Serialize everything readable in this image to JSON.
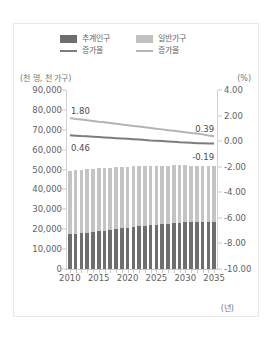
{
  "chart_data": {
    "type": "bar",
    "title": "",
    "subtitle": "",
    "xlabel": "(년)",
    "ylabel": "(천 명, 천 가구)",
    "ylabel_right": "(%)",
    "ylim": [
      0,
      90000
    ],
    "ylim_right": [
      -10.0,
      4.0
    ],
    "grid": false,
    "legend_position": "top-center",
    "x": [
      2010,
      2011,
      2012,
      2013,
      2014,
      2015,
      2016,
      2017,
      2018,
      2019,
      2020,
      2021,
      2022,
      2023,
      2024,
      2025,
      2026,
      2027,
      2028,
      2029,
      2030,
      2031,
      2032,
      2033,
      2034,
      2035
    ],
    "categories": [
      "2010",
      "2011",
      "2012",
      "2013",
      "2014",
      "2015",
      "2016",
      "2017",
      "2018",
      "2019",
      "2020",
      "2021",
      "2022",
      "2023",
      "2024",
      "2025",
      "2026",
      "2027",
      "2028",
      "2029",
      "2030",
      "2031",
      "2032",
      "2033",
      "2034",
      "2035"
    ],
    "xticks": [
      "2010",
      "2015",
      "2020",
      "2025",
      "2030",
      "2035"
    ],
    "yticks_left": [
      "90,000",
      "80,000",
      "70,000",
      "60,000",
      "50,000",
      "40,000",
      "30,000",
      "20,000",
      "10,000",
      "0"
    ],
    "yticks_right": [
      "4.00",
      "2.00",
      "0.00",
      "-2.00",
      "-4.00",
      "-6.00",
      "-8.00",
      "-10.00"
    ],
    "series": [
      {
        "name": "추계인구",
        "type": "bar",
        "axis": "left",
        "color": "#6e6e6e",
        "values": [
          17359,
          17687,
          18015,
          18344,
          18672,
          19001,
          19357,
          19713,
          20069,
          20424,
          20780,
          21086,
          21392,
          21698,
          22004,
          22310,
          22528,
          22746,
          22964,
          23182,
          23400,
          23480,
          23560,
          23640,
          23720,
          23800
        ]
      },
      {
        "name": "일반가구",
        "type": "bar",
        "axis": "left",
        "color": "#c4c4c4",
        "values": [
          49410,
          49780,
          50004,
          50220,
          50424,
          50617,
          50801,
          50977,
          51141,
          51296,
          51435,
          51561,
          51672,
          51771,
          51856,
          51927,
          51984,
          52027,
          52055,
          52069,
          52069,
          52038,
          51993,
          51933,
          51859,
          51771
        ]
      },
      {
        "name": "증가율",
        "type": "line",
        "axis": "right",
        "color": "#b4b4b4",
        "legend_for": "일반가구",
        "values": [
          1.8,
          1.74,
          1.69,
          1.63,
          1.58,
          1.52,
          1.47,
          1.41,
          1.36,
          1.3,
          1.25,
          1.19,
          1.14,
          1.08,
          1.03,
          0.97,
          0.92,
          0.86,
          0.81,
          0.75,
          0.7,
          0.64,
          0.59,
          0.53,
          0.45,
          0.39
        ]
      },
      {
        "name": "증가율",
        "type": "line",
        "axis": "right",
        "color": "#7d7d7d",
        "legend_for": "추계인구",
        "values": [
          0.46,
          0.43,
          0.4,
          0.38,
          0.35,
          0.32,
          0.29,
          0.26,
          0.23,
          0.21,
          0.18,
          0.15,
          0.12,
          0.09,
          0.06,
          0.04,
          0.01,
          -0.02,
          -0.05,
          -0.08,
          -0.1,
          -0.13,
          -0.16,
          -0.17,
          -0.18,
          -0.19
        ]
      }
    ],
    "annotations": [
      {
        "text": "1.80",
        "series": "일반가구 증가율",
        "at": "start"
      },
      {
        "text": "0.46",
        "series": "추계인구 증가율",
        "at": "start"
      },
      {
        "text": "0.39",
        "series": "일반가구 증가율",
        "at": "end"
      },
      {
        "text": "-0.19",
        "series": "추계인구 증가율",
        "at": "end"
      }
    ]
  },
  "legend": {
    "row1": [
      {
        "label": "추계인구",
        "marker": "swatch",
        "color": "#6e6e6e"
      },
      {
        "label": "일반가구",
        "marker": "swatch",
        "color": "#c0c0c0"
      }
    ],
    "row2": [
      {
        "label": "증가율",
        "marker": "line",
        "color": "#7d7d7d"
      },
      {
        "label": "증가율",
        "marker": "line",
        "color": "#b4b4b4"
      }
    ]
  },
  "axes": {
    "left_unit": "(천 명, 천 가구)",
    "right_unit": "(%)",
    "x_unit": "(년)"
  }
}
